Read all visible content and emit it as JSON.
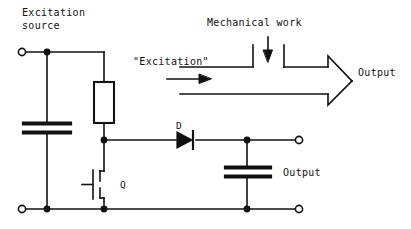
{
  "diagram": {
    "title_text": "Excitation source",
    "labels": {
      "excitation_source_line1": "Excitation",
      "excitation_source_line2": "source",
      "excitation_quoted": "\"Excitation\"",
      "mechanical_work": "Mechanical work",
      "output_arrow": "Output",
      "output_cap": "Output",
      "diode_ref": "D",
      "transistor_ref": "Q"
    },
    "components": [
      {
        "ref": "",
        "type": "capacitor",
        "name": "input-capacitor"
      },
      {
        "ref": "",
        "type": "inductor",
        "name": "inductor-rectangle"
      },
      {
        "ref": "Q",
        "type": "mosfet",
        "name": "transistor-q"
      },
      {
        "ref": "D",
        "type": "diode",
        "name": "diode-d"
      },
      {
        "ref": "",
        "type": "capacitor",
        "name": "output-capacitor"
      }
    ],
    "terminals": [
      {
        "name": "input-terminal-top",
        "x": 22,
        "y": 52
      },
      {
        "name": "input-terminal-bottom",
        "x": 22,
        "y": 209
      },
      {
        "name": "output-terminal-top",
        "x": 299,
        "y": 140
      },
      {
        "name": "output-terminal-bottom",
        "x": 299,
        "y": 209
      }
    ],
    "junction_dots": [
      {
        "name": "junction-source-top",
        "x": 47,
        "y": 52
      },
      {
        "name": "junction-source-bottom",
        "x": 47,
        "y": 209
      },
      {
        "name": "junction-drain",
        "x": 104,
        "y": 140
      },
      {
        "name": "junction-transistor-source",
        "x": 104,
        "y": 209
      },
      {
        "name": "junction-output-top",
        "x": 247,
        "y": 140
      },
      {
        "name": "junction-output-bottom",
        "x": 247,
        "y": 209
      }
    ],
    "colors": {
      "stroke": "#111111",
      "background": "#ffffff",
      "text": "#111111"
    }
  }
}
